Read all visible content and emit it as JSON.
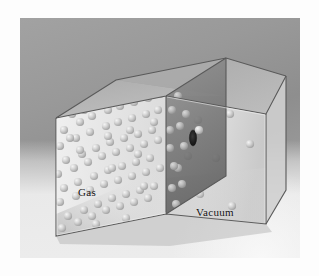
{
  "figure": {
    "type": "3d-illustration"
  },
  "labels": {
    "gas": "Gas",
    "vacuum": "Vacuum"
  },
  "colors": {
    "backdrop": "#999999",
    "floor": "#ececec",
    "glass_face": "#e9e9e9",
    "glass_side": "#d2d2d2",
    "glass_top": "#b4b4b4",
    "partition": "#6f6f6f",
    "edge": "#555555",
    "particle": "#c9c9c9",
    "hole": "#1d1d1d",
    "label_text": "#111111"
  },
  "geometry": {
    "photo_area": {
      "x": 20,
      "y": 18,
      "width": 280,
      "height": 240
    },
    "box_front_face": [
      [
        36,
        100
      ],
      [
        146,
        78
      ],
      [
        146,
        196
      ],
      [
        36,
        218
      ]
    ],
    "box_right_face": [
      [
        146,
        78
      ],
      [
        246,
        96
      ],
      [
        246,
        206
      ],
      [
        146,
        196
      ]
    ],
    "box_top_face": [
      [
        36,
        100
      ],
      [
        96,
        62
      ],
      [
        206,
        78
      ],
      [
        146,
        78
      ]
    ],
    "partition_plane": [
      [
        146,
        78
      ],
      [
        206,
        40
      ],
      [
        206,
        158
      ],
      [
        146,
        196
      ]
    ],
    "hole": {
      "cx": 173,
      "cy": 120,
      "rx": 4,
      "ry": 8
    }
  },
  "chart_data": {
    "type": "scatter",
    "xlabel": "",
    "ylabel": "",
    "legend": [
      "Gas",
      "Vacuum"
    ],
    "series": [
      {
        "name": "Gas",
        "count": 78,
        "points": [
          [
            52,
            96
          ],
          [
            68,
            86
          ],
          [
            84,
            80
          ],
          [
            96,
            74
          ],
          [
            108,
            70
          ],
          [
            120,
            66
          ],
          [
            132,
            64
          ],
          [
            44,
            112
          ],
          [
            60,
            104
          ],
          [
            72,
            98
          ],
          [
            88,
            92
          ],
          [
            100,
            88
          ],
          [
            114,
            84
          ],
          [
            128,
            80
          ],
          [
            140,
            76
          ],
          [
            40,
            128
          ],
          [
            56,
            120
          ],
          [
            70,
            114
          ],
          [
            86,
            108
          ],
          [
            98,
            104
          ],
          [
            112,
            100
          ],
          [
            126,
            96
          ],
          [
            138,
            92
          ],
          [
            46,
            142
          ],
          [
            62,
            136
          ],
          [
            76,
            130
          ],
          [
            90,
            124
          ],
          [
            104,
            120
          ],
          [
            118,
            116
          ],
          [
            132,
            112
          ],
          [
            38,
            156
          ],
          [
            54,
            150
          ],
          [
            68,
            144
          ],
          [
            82,
            138
          ],
          [
            96,
            134
          ],
          [
            110,
            130
          ],
          [
            124,
            126
          ],
          [
            138,
            122
          ],
          [
            44,
            170
          ],
          [
            58,
            164
          ],
          [
            74,
            158
          ],
          [
            88,
            152
          ],
          [
            102,
            148
          ],
          [
            116,
            144
          ],
          [
            130,
            140
          ],
          [
            40,
            184
          ],
          [
            56,
            178
          ],
          [
            70,
            172
          ],
          [
            84,
            166
          ],
          [
            98,
            162
          ],
          [
            112,
            158
          ],
          [
            126,
            154
          ],
          [
            140,
            150
          ],
          [
            48,
            198
          ],
          [
            64,
            192
          ],
          [
            78,
            186
          ],
          [
            92,
            180
          ],
          [
            106,
            176
          ],
          [
            120,
            172
          ],
          [
            134,
            168
          ],
          [
            42,
            210
          ],
          [
            58,
            204
          ],
          [
            72,
            198
          ],
          [
            86,
            192
          ],
          [
            100,
            188
          ],
          [
            114,
            184
          ],
          [
            128,
            180
          ],
          [
            50,
            120
          ],
          [
            64,
            92
          ],
          [
            92,
            150
          ],
          [
            118,
            136
          ],
          [
            134,
            104
          ],
          [
            106,
            200
          ],
          [
            76,
            206
          ],
          [
            60,
            132
          ],
          [
            110,
            112
          ],
          [
            124,
            168
          ],
          [
            88,
            118
          ]
        ]
      },
      {
        "name": "Vacuum",
        "count": 8,
        "points": [
          [
            178,
            102
          ],
          [
            210,
            96
          ],
          [
            168,
            138
          ],
          [
            196,
            140
          ],
          [
            230,
            126
          ],
          [
            180,
            176
          ],
          [
            212,
            188
          ],
          [
            172,
            120
          ]
        ]
      }
    ],
    "annotations": [
      {
        "text": "Gas",
        "x": 58,
        "y": 168
      },
      {
        "text": "Vacuum",
        "x": 176,
        "y": 188
      },
      {
        "text": "pinhole",
        "x": 173,
        "y": 120
      }
    ]
  }
}
